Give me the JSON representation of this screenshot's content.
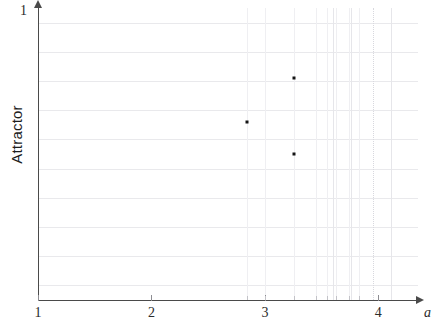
{
  "chart_data": {
    "type": "scatter",
    "title": "",
    "xlabel": "a",
    "ylabel": "Attractor",
    "xlim": [
      1,
      4.35
    ],
    "ylim": [
      0,
      1
    ],
    "grid": true,
    "legend": false,
    "x_ticks": [
      {
        "value": 1,
        "label": "1"
      },
      {
        "value": 2,
        "label": "2"
      },
      {
        "value": 3,
        "label": "3"
      },
      {
        "value": 4,
        "label": "4"
      }
    ],
    "x_minor_ticks": [
      2.84,
      3.0,
      3.26,
      3.45,
      3.55,
      3.63,
      3.74,
      3.83
    ],
    "y_ticks": [
      {
        "value": 1,
        "label": "1"
      }
    ],
    "y_gridlines": [
      0.05,
      0.15,
      0.25,
      0.35,
      0.45,
      0.55,
      0.65,
      0.75,
      0.85,
      0.95
    ],
    "vertical_gridlines": [
      2.84,
      3.26,
      3.6,
      3.76,
      3.95,
      4.11
    ],
    "vertical_gridlines_dotted": [
      3.95
    ],
    "points": [
      {
        "x": 2.84,
        "y": 0.61,
        "label": ""
      },
      {
        "x": 3.26,
        "y": 0.76,
        "label": ""
      },
      {
        "x": 3.26,
        "y": 0.5,
        "label": ""
      }
    ]
  },
  "axes": {
    "y_top_label": "1",
    "y_title": "Attractor",
    "x_title": "a",
    "x_tick_labels": [
      "1",
      "2",
      "3",
      "4"
    ]
  },
  "colors": {
    "point": "#141414",
    "axis": "#4a4a4a",
    "grid": "#e9e9ec",
    "grid_vertical": "#e6e6ea",
    "background": "#ffffff",
    "text": "#2b2b2b"
  }
}
